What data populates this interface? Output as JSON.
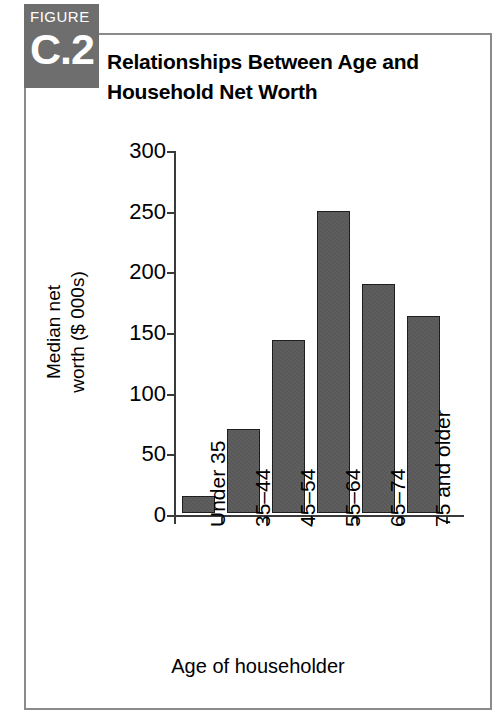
{
  "figure": {
    "badge_word": "FIGURE",
    "badge_number": "C.2",
    "title": "Relationships Between Age and Household Net Worth"
  },
  "colors": {
    "badge_background": "#6e6e6e",
    "frame_border": "#8a8a8a",
    "bar_fill": "#585858",
    "bar_stroke": "#1e1e1e",
    "axis": "#3a3a3a",
    "text": "#000000"
  },
  "chart_data": {
    "type": "bar",
    "title": "Relationships Between Age and Household Net Worth",
    "categories": [
      "Under 35",
      "35–44",
      "45–54",
      "55–64",
      "65–74",
      "75 and older"
    ],
    "values": [
      14,
      69,
      143,
      249,
      189,
      162
    ],
    "xlabel": "Age of householder",
    "ylabel": "Median net worth ($ 000s)",
    "ylabel_lines": [
      "Median net",
      "worth ($ 000s)"
    ],
    "ylim": [
      0,
      300
    ],
    "ytick_labels": [
      "0",
      "50",
      "100",
      "150",
      "200",
      "250",
      "300"
    ],
    "ytick_values": [
      0,
      50,
      100,
      150,
      200,
      250,
      300
    ],
    "grid": false,
    "legend": null,
    "legend_position": "none",
    "xtick_rotation": 90
  }
}
